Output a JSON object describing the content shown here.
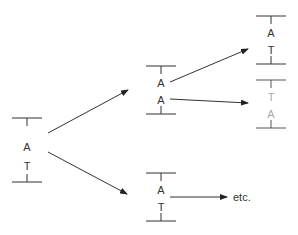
{
  "diagram": {
    "colors": {
      "line": "#333333",
      "text": "#333333",
      "faded": "#aaaaaa",
      "background": "#ffffff"
    },
    "nodes": [
      {
        "id": "root",
        "top": "A",
        "bottom": "T",
        "faded": false
      },
      {
        "id": "mid-top",
        "top": "A",
        "bottom": "A",
        "faded": false
      },
      {
        "id": "mid-bottom",
        "top": "A",
        "bottom": "T",
        "faded": false
      },
      {
        "id": "right-top",
        "top": "A",
        "bottom": "T",
        "faded": false
      },
      {
        "id": "right-second",
        "top": "T",
        "bottom": "A",
        "faded": true
      }
    ],
    "continuation_label": "etc."
  }
}
